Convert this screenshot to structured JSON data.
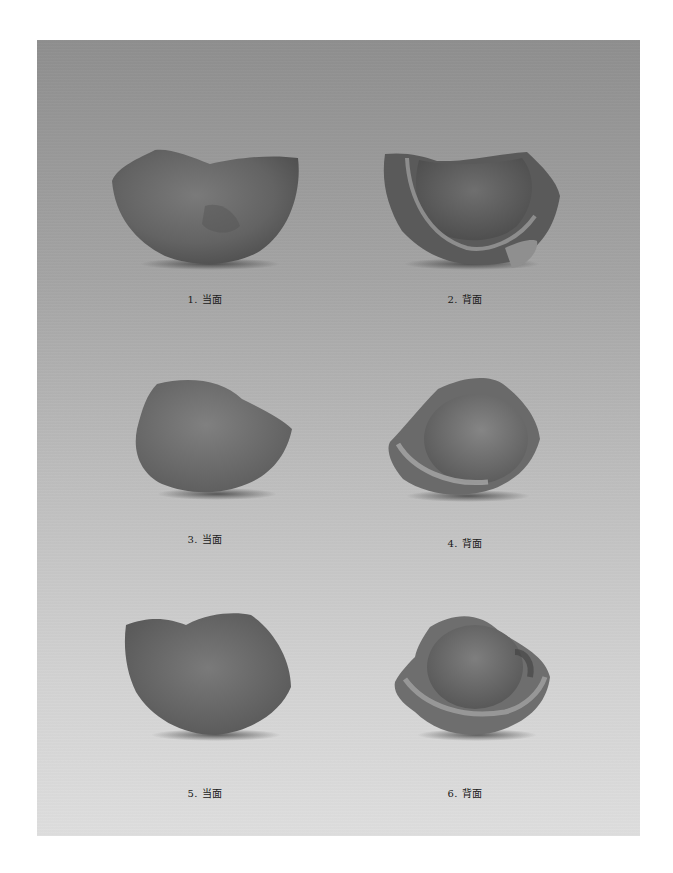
{
  "plate": {
    "background_top": "#8e8e8e",
    "background_bottom": "#dedede",
    "figures": [
      {
        "number": "1",
        "label": "1. 当面",
        "view": "front"
      },
      {
        "number": "2",
        "label": "2. 背面",
        "view": "back"
      },
      {
        "number": "3",
        "label": "3. 当面",
        "view": "front"
      },
      {
        "number": "4",
        "label": "4. 背面",
        "view": "back"
      },
      {
        "number": "5",
        "label": "5. 当面",
        "view": "front"
      },
      {
        "number": "6",
        "label": "6. 背面",
        "view": "back"
      }
    ]
  },
  "caption": {
    "text": "",
    "note": "plate caption cut off at bottom edge"
  }
}
